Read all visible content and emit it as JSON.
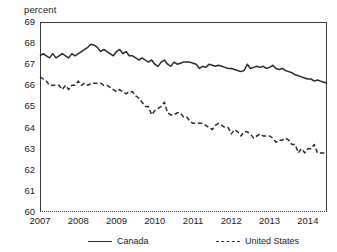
{
  "axis_unit_label": "percent",
  "legend": [
    {
      "label": "Canada",
      "style": "solid"
    },
    {
      "label": "United States",
      "style": "dashed"
    }
  ],
  "chart_data": {
    "type": "line",
    "title": "",
    "subtitle": "",
    "xlabel": "",
    "ylabel": "percent",
    "ylim": [
      60,
      69
    ],
    "xlim": [
      2007.0,
      2014.5
    ],
    "grid": false,
    "legend_position": "bottom",
    "ytick_labels": [
      "69",
      "68",
      "67",
      "66",
      "65",
      "64",
      "63",
      "62",
      "61",
      "60"
    ],
    "yticks": [
      69,
      68,
      67,
      66,
      65,
      64,
      63,
      62,
      61,
      60
    ],
    "xtick_labels": [
      "2007",
      "2008",
      "2009",
      "2010",
      "2011",
      "2012",
      "2013",
      "2014"
    ],
    "xticks": [
      2007,
      2008,
      2009,
      2010,
      2011,
      2012,
      2013,
      2014
    ],
    "series": [
      {
        "name": "Canada",
        "style": "solid",
        "color": "#2b2b2b",
        "x": [
          2007.0,
          2007.083,
          2007.167,
          2007.25,
          2007.333,
          2007.417,
          2007.5,
          2007.583,
          2007.667,
          2007.75,
          2007.833,
          2007.917,
          2008.0,
          2008.083,
          2008.167,
          2008.25,
          2008.333,
          2008.417,
          2008.5,
          2008.583,
          2008.667,
          2008.75,
          2008.833,
          2008.917,
          2009.0,
          2009.083,
          2009.167,
          2009.25,
          2009.333,
          2009.417,
          2009.5,
          2009.583,
          2009.667,
          2009.75,
          2009.833,
          2009.917,
          2010.0,
          2010.083,
          2010.167,
          2010.25,
          2010.333,
          2010.417,
          2010.5,
          2010.583,
          2010.667,
          2010.75,
          2010.833,
          2010.917,
          2011.0,
          2011.083,
          2011.167,
          2011.25,
          2011.333,
          2011.417,
          2011.5,
          2011.583,
          2011.667,
          2011.75,
          2011.833,
          2011.917,
          2012.0,
          2012.083,
          2012.167,
          2012.25,
          2012.333,
          2012.417,
          2012.5,
          2012.583,
          2012.667,
          2012.75,
          2012.833,
          2012.917,
          2013.0,
          2013.083,
          2013.167,
          2013.25,
          2013.333,
          2013.417,
          2013.5,
          2013.583,
          2013.667,
          2013.75,
          2013.833,
          2013.917,
          2014.0,
          2014.083,
          2014.167,
          2014.25,
          2014.333,
          2014.417,
          2014.5
        ],
        "values": [
          67.4,
          67.5,
          67.4,
          67.3,
          67.5,
          67.3,
          67.4,
          67.5,
          67.4,
          67.3,
          67.5,
          67.4,
          67.5,
          67.6,
          67.7,
          67.8,
          67.95,
          67.9,
          67.8,
          67.6,
          67.7,
          67.6,
          67.5,
          67.4,
          67.6,
          67.7,
          67.5,
          67.6,
          67.4,
          67.4,
          67.3,
          67.2,
          67.3,
          67.2,
          67.1,
          67.2,
          67.0,
          66.9,
          67.1,
          67.2,
          67.0,
          66.9,
          67.1,
          67.0,
          67.05,
          67.1,
          67.1,
          67.1,
          67.05,
          67.0,
          66.8,
          66.9,
          66.85,
          67.0,
          66.95,
          66.9,
          66.95,
          66.9,
          66.85,
          66.8,
          66.8,
          66.75,
          66.7,
          66.65,
          66.7,
          67.0,
          66.8,
          66.85,
          66.9,
          66.85,
          66.9,
          66.8,
          66.85,
          66.95,
          66.8,
          66.75,
          66.8,
          66.7,
          66.65,
          66.6,
          66.5,
          66.45,
          66.4,
          66.35,
          66.3,
          66.3,
          66.2,
          66.25,
          66.2,
          66.15,
          66.1
        ]
      },
      {
        "name": "United States",
        "style": "dashed",
        "color": "#2b2b2b",
        "x": [
          2007.0,
          2007.083,
          2007.167,
          2007.25,
          2007.333,
          2007.417,
          2007.5,
          2007.583,
          2007.667,
          2007.75,
          2007.833,
          2007.917,
          2008.0,
          2008.083,
          2008.167,
          2008.25,
          2008.333,
          2008.417,
          2008.5,
          2008.583,
          2008.667,
          2008.75,
          2008.833,
          2008.917,
          2009.0,
          2009.083,
          2009.167,
          2009.25,
          2009.333,
          2009.417,
          2009.5,
          2009.583,
          2009.667,
          2009.75,
          2009.833,
          2009.917,
          2010.0,
          2010.083,
          2010.167,
          2010.25,
          2010.333,
          2010.417,
          2010.5,
          2010.583,
          2010.667,
          2010.75,
          2010.833,
          2010.917,
          2011.0,
          2011.083,
          2011.167,
          2011.25,
          2011.333,
          2011.417,
          2011.5,
          2011.583,
          2011.667,
          2011.75,
          2011.833,
          2011.917,
          2012.0,
          2012.083,
          2012.167,
          2012.25,
          2012.333,
          2012.417,
          2012.5,
          2012.583,
          2012.667,
          2012.75,
          2012.833,
          2012.917,
          2013.0,
          2013.083,
          2013.167,
          2013.25,
          2013.333,
          2013.417,
          2013.5,
          2013.583,
          2013.667,
          2013.75,
          2013.833,
          2013.917,
          2014.0,
          2014.083,
          2014.167,
          2014.25,
          2014.333,
          2014.417,
          2014.5
        ],
        "values": [
          66.4,
          66.3,
          66.2,
          66.0,
          66.0,
          66.0,
          66.0,
          65.8,
          66.0,
          65.8,
          66.0,
          66.0,
          66.2,
          66.0,
          66.1,
          66.0,
          66.1,
          66.1,
          66.1,
          66.1,
          66.0,
          66.0,
          65.9,
          65.8,
          65.7,
          65.8,
          65.7,
          65.6,
          65.7,
          65.7,
          65.5,
          65.4,
          65.2,
          65.0,
          65.0,
          64.6,
          64.8,
          64.9,
          65.0,
          65.2,
          64.7,
          64.6,
          64.6,
          64.7,
          64.7,
          64.5,
          64.5,
          64.3,
          64.2,
          64.2,
          64.2,
          64.2,
          64.1,
          64.0,
          63.9,
          64.1,
          64.2,
          64.1,
          64.0,
          64.0,
          63.7,
          63.9,
          63.8,
          63.6,
          63.8,
          63.8,
          63.7,
          63.5,
          63.6,
          63.7,
          63.6,
          63.6,
          63.6,
          63.5,
          63.3,
          63.4,
          63.4,
          63.5,
          63.4,
          63.2,
          63.2,
          62.8,
          63.0,
          62.8,
          63.0,
          63.0,
          63.2,
          62.8,
          62.8,
          62.8,
          62.8
        ]
      }
    ]
  }
}
